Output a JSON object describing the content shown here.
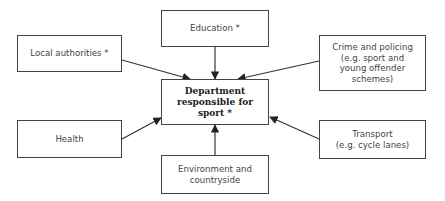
{
  "diagram": {
    "center": {
      "label": "Department\nresponsible for\nsport *"
    },
    "nodes": [
      {
        "id": "local-authorities",
        "label": "Local authorities *"
      },
      {
        "id": "education",
        "label": "Education *"
      },
      {
        "id": "crime-policing",
        "label": "Crime and policing\n(e.g. sport and\nyoung offender\nschemes)"
      },
      {
        "id": "health",
        "label": "Health"
      },
      {
        "id": "environment",
        "label": "Environment and\ncountryside"
      },
      {
        "id": "transport",
        "label": "Transport\n(e.g. cycle lanes)"
      }
    ],
    "edges": [
      {
        "from": "local-authorities",
        "to": "center"
      },
      {
        "from": "education",
        "to": "center"
      },
      {
        "from": "crime-policing",
        "to": "center"
      },
      {
        "from": "health",
        "to": "center"
      },
      {
        "from": "environment",
        "to": "center"
      },
      {
        "from": "transport",
        "to": "center"
      }
    ]
  }
}
